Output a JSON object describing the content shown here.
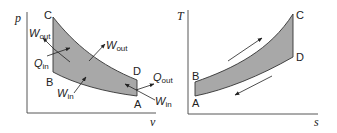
{
  "pv_diagram": {
    "axes": {
      "y_label": "p",
      "x_label": "v"
    },
    "points": {
      "A": "A",
      "B": "B",
      "C": "C",
      "D": "D"
    },
    "labels": {
      "w_out_left": {
        "main": "W",
        "sub": "out"
      },
      "q_in": {
        "main": "Q",
        "sub": "in"
      },
      "w_out_mid": {
        "main": "W",
        "sub": "out"
      },
      "w_in_bottom": {
        "main": "W",
        "sub": "in"
      },
      "q_out": {
        "main": "Q",
        "sub": "out"
      },
      "w_in_right": {
        "main": "W",
        "sub": "in"
      }
    }
  },
  "ts_diagram": {
    "axes": {
      "y_label": "T",
      "x_label": "s"
    },
    "points": {
      "A": "A",
      "B": "B",
      "C": "C",
      "D": "D"
    }
  },
  "colors": {
    "fill": "#a8a8a8",
    "stroke": "#333333",
    "axis": "#444444"
  }
}
